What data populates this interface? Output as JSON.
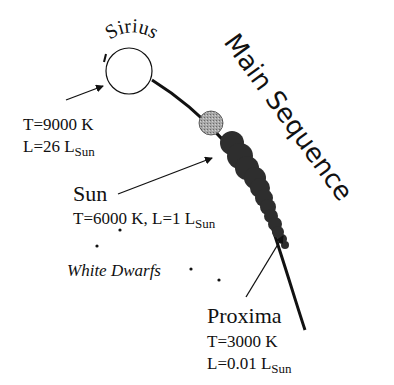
{
  "diagram": {
    "title": "Main Sequence",
    "stars": {
      "sirius": {
        "name": "Sirius",
        "temp": "T=9000 K",
        "lum_prefix": "L=26 L",
        "lum_sub": "Sun"
      },
      "sun": {
        "name": "Sun",
        "line": "T=6000 K, L=1 L",
        "lum_sub": "Sun"
      },
      "proxima": {
        "name": "Proxima",
        "temp": "T=3000 K",
        "lum_prefix": "L=0.01 L",
        "lum_sub": "Sun"
      }
    },
    "white_dwarfs": {
      "label": "White Dwarfs"
    },
    "colors": {
      "ink": "#111111",
      "sun_fill": "#9a9a9a",
      "sequence_fill": "#2e2e2e",
      "sirius_fill": "#ffffff"
    }
  }
}
